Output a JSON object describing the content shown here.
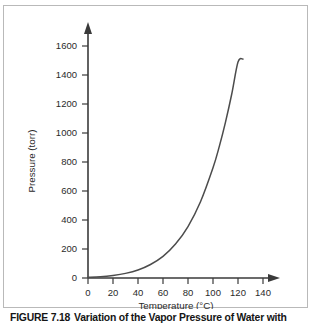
{
  "figure": {
    "caption_label": "FIGURE 7.18",
    "caption_text": "Variation of the Vapor Pressure of Water with",
    "frame_color": "#b9b9b9",
    "background_color": "#ffffff"
  },
  "chart_data": {
    "type": "line",
    "title": "",
    "xlabel": "Temperature (°C)",
    "ylabel": "Pressure (torr)",
    "xlim": [
      0,
      150
    ],
    "ylim": [
      0,
      1700
    ],
    "xticks": [
      0,
      20,
      40,
      60,
      80,
      100,
      120,
      140
    ],
    "xtick_labels": [
      "0",
      "20",
      "40",
      "60",
      "80",
      "100",
      "120",
      "140"
    ],
    "yticks": [
      0,
      200,
      400,
      600,
      800,
      1000,
      1200,
      1400,
      1600
    ],
    "ytick_labels": [
      "0",
      "200",
      "400",
      "600",
      "800",
      "1000",
      "1200",
      "1400",
      "1600"
    ],
    "grid": false,
    "legend": false,
    "axis_arrows": true,
    "line_color": "#4c4c4c",
    "series": [
      {
        "name": "Vapor pressure of water",
        "x": [
          0,
          10,
          20,
          30,
          40,
          50,
          60,
          70,
          80,
          90,
          100,
          105,
          110,
          115,
          120,
          124
        ],
        "y": [
          5,
          9,
          18,
          32,
          55,
          93,
          149,
          234,
          355,
          526,
          760,
          906,
          1075,
          1269,
          1489,
          1510
        ]
      }
    ],
    "annotations": []
  },
  "axes": {
    "x_axis_name": "temperature-axis",
    "y_axis_name": "pressure-axis"
  }
}
